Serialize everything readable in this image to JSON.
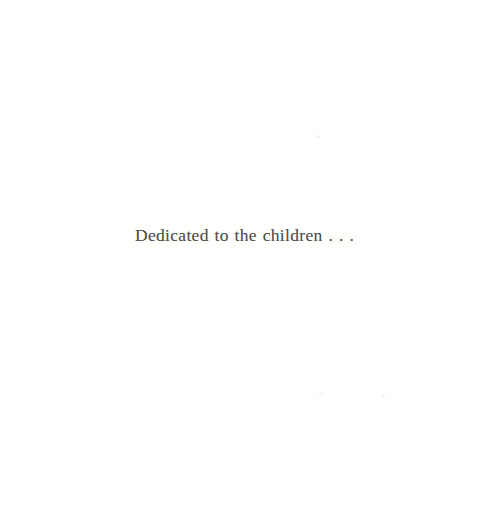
{
  "page": {
    "kind": "book-dedication-page",
    "background_color": "#fffffe",
    "width": 493,
    "height": 528
  },
  "dedication": {
    "text": "Dedicated to the children . . .",
    "ink_color": "#4a4744",
    "alignment": "center"
  },
  "artifacts": {
    "speck_color": "#f3f1ef",
    "count": 3
  }
}
